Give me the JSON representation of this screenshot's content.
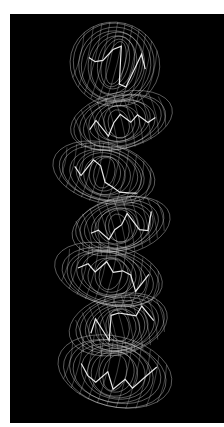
{
  "figure": {
    "background_color": "#000000",
    "page_color": "#ffffff",
    "mesh_color": "#d8d8d8",
    "highlight_color": "#ffffff",
    "mesh_lobes": [
      {
        "cx": 105,
        "cy": 50,
        "rx": 45,
        "ry": 42
      },
      {
        "cx": 110,
        "cy": 108,
        "rx": 52,
        "ry": 28
      },
      {
        "cx": 95,
        "cy": 160,
        "rx": 52,
        "ry": 30
      },
      {
        "cx": 110,
        "cy": 212,
        "rx": 50,
        "ry": 28
      },
      {
        "cx": 100,
        "cy": 262,
        "rx": 55,
        "ry": 30
      },
      {
        "cx": 110,
        "cy": 312,
        "rx": 50,
        "ry": 30
      },
      {
        "cx": 105,
        "cy": 358,
        "rx": 58,
        "ry": 35
      }
    ]
  }
}
